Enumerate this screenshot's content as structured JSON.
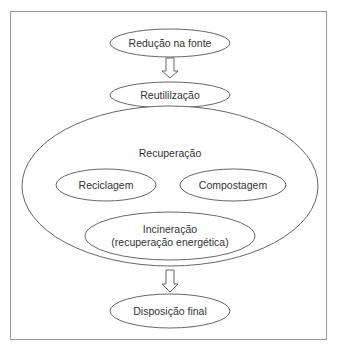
{
  "diagram": {
    "type": "waste-management-hierarchy",
    "colors": {
      "stroke": "#555555",
      "frame": "#9a9a9a",
      "text": "#333333",
      "background": "#ffffff"
    },
    "nodes": {
      "source_reduction": "Redução na fonte",
      "reuse": "Reutililzação",
      "recovery": "Recuperação",
      "recycling": "Reciclagem",
      "composting": "Compostagem",
      "incineration_line1": "Incineração",
      "incineration_line2": "(recuperação energética)",
      "final_disposal": "Disposição final"
    },
    "edges": [
      {
        "from": "source_reduction",
        "to": "reuse",
        "style": "hollow-arrow"
      },
      {
        "from": "reuse",
        "to": "recovery",
        "style": "hollow-arrow"
      },
      {
        "from": "recovery",
        "to": "final_disposal",
        "style": "hollow-arrow"
      }
    ]
  }
}
